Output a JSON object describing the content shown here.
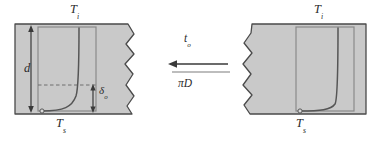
{
  "figure": {
    "background_color": "#ffffff",
    "width": 383,
    "height": 141
  },
  "colors": {
    "block_fill": "#c9c9c9",
    "block_stroke": "#4a4a4a",
    "profile_stroke": "#555555",
    "box_stroke": "#8a8a8a",
    "dashed_stroke": "#6e6e6e",
    "arrow_stroke": "#3a3a3a",
    "text": "#2b2b2b"
  },
  "left_panel": {
    "name": "left-block-diagram",
    "labels": {
      "surface_top": {
        "symbol": "T",
        "subscript": "i"
      },
      "surface_bottom": {
        "symbol": "T",
        "subscript": "s"
      },
      "thickness": {
        "symbol": "d",
        "subscript": ""
      },
      "boundary_layer": {
        "symbol": "δ",
        "subscript": "o"
      }
    },
    "has_torn_edge": true,
    "torn_edge_side": "right",
    "dimension_arrows": [
      "thickness-d",
      "boundary-layer-delta"
    ],
    "dashed_reference_line": true
  },
  "right_panel": {
    "name": "right-block-diagram",
    "labels": {
      "surface_top": {
        "symbol": "T",
        "subscript": "i"
      },
      "surface_bottom": {
        "symbol": "T",
        "subscript": "s"
      }
    },
    "has_torn_edge": true,
    "torn_edge_side": "left",
    "dimension_arrows": [],
    "dashed_reference_line": false
  },
  "center": {
    "name": "transition-arrow-group",
    "arrow_direction": "left",
    "fraction": {
      "numerator": {
        "symbol": "t",
        "subscript": "o"
      },
      "denominator": "πD"
    }
  }
}
